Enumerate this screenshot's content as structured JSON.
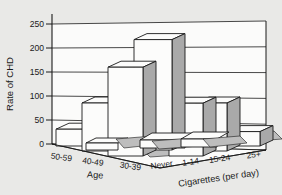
{
  "figure": {
    "kind": "scanned textbook pseudo-3d bar chart",
    "background": "#e9e9e7"
  },
  "chart_data": {
    "type": "bar",
    "variant": "pseudo-3d-corner",
    "title": "",
    "ylabel": "Rate of CHD",
    "ylim": [
      0,
      250
    ],
    "yticks": [
      0,
      50,
      100,
      150,
      200,
      250
    ],
    "grid": true,
    "categories": [
      "50-59",
      "40-49",
      "30-39",
      "Never",
      "1-14",
      "15-24",
      "25+"
    ],
    "values": [
      35,
      100,
      185,
      230,
      110,
      100,
      30
    ],
    "axis_groups": [
      {
        "label": "Age",
        "categories": [
          "50-59",
          "40-49",
          "30-39"
        ],
        "values": [
          35,
          100,
          185
        ]
      },
      {
        "label": "Cigarettes (per day)",
        "categories": [
          "Never",
          "1-14",
          "15-24",
          "25+"
        ],
        "values": [
          230,
          110,
          100,
          30
        ]
      }
    ],
    "legend": null,
    "colors": {
      "bar_front": "#fcfcfb",
      "bar_top": "#fcfcfb",
      "bar_side": "#a9a9a9",
      "shadow": "#bdbdbd",
      "line": "#1a1a1a",
      "wall": "#fbfbfa"
    }
  }
}
